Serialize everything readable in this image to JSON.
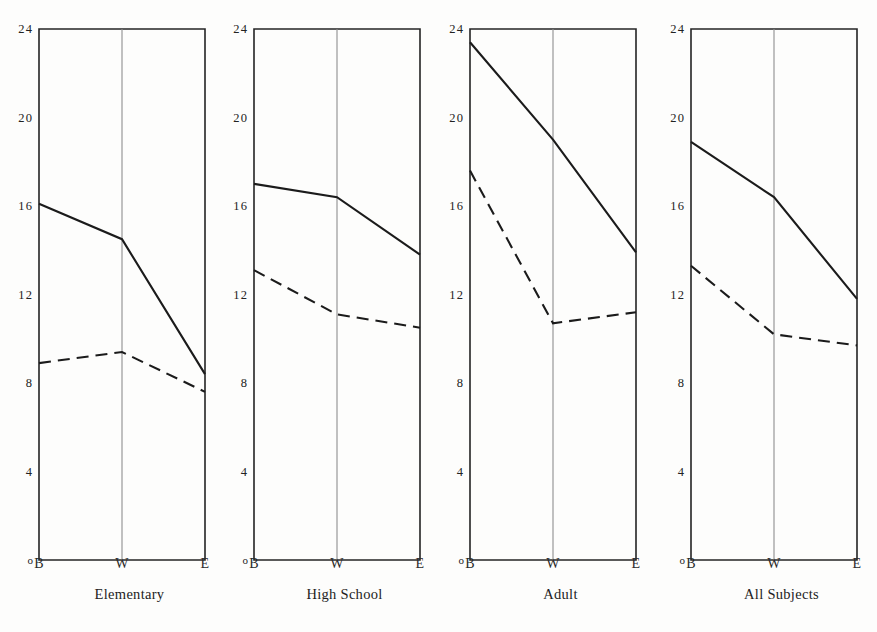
{
  "figure": {
    "background": "#fdfdfc",
    "ink_color": "#1b1b1b",
    "gridline_color": "#8e8e8e"
  },
  "chart_data": {
    "type": "line",
    "title": "",
    "subtitle": "",
    "xlabel": "",
    "ylabel": "",
    "xtick_labels": [
      "B",
      "W",
      "E"
    ],
    "x": [
      0,
      1,
      2
    ],
    "ytick_labels": [
      "0",
      "4",
      "8",
      "12",
      "16",
      "20",
      "24"
    ],
    "ytick_values": [
      0,
      4,
      8,
      12,
      16,
      20,
      24
    ],
    "ylim": [
      0,
      24
    ],
    "grid": false,
    "legend": "none",
    "panel_layout": "1x4",
    "panels": [
      {
        "name": "Elementary",
        "caption": "Elementary",
        "categories": [
          "B",
          "W",
          "E"
        ],
        "series": [
          {
            "name": "solid",
            "style": "solid",
            "values": [
              16.1,
              14.5,
              8.4
            ]
          },
          {
            "name": "dashed",
            "style": "dashed",
            "values": [
              8.9,
              9.4,
              7.6
            ]
          }
        ]
      },
      {
        "name": "High School",
        "caption": "High School",
        "categories": [
          "B",
          "W",
          "E"
        ],
        "series": [
          {
            "name": "solid",
            "style": "solid",
            "values": [
              17.0,
              16.4,
              13.8
            ]
          },
          {
            "name": "dashed",
            "style": "dashed",
            "values": [
              13.1,
              11.1,
              10.5
            ]
          }
        ]
      },
      {
        "name": "Adult",
        "caption": "Adult",
        "categories": [
          "B",
          "W",
          "E"
        ],
        "series": [
          {
            "name": "solid",
            "style": "solid",
            "values": [
              23.4,
              19.0,
              13.9
            ]
          },
          {
            "name": "dashed",
            "style": "dashed",
            "values": [
              17.6,
              10.7,
              11.2
            ]
          }
        ]
      },
      {
        "name": "All Subjects",
        "caption": "All Subjects",
        "categories": [
          "B",
          "W",
          "E"
        ],
        "series": [
          {
            "name": "solid",
            "style": "solid",
            "values": [
              18.9,
              16.4,
              11.8
            ]
          },
          {
            "name": "dashed",
            "style": "dashed",
            "values": [
              13.3,
              10.2,
              9.7
            ]
          }
        ]
      }
    ]
  }
}
